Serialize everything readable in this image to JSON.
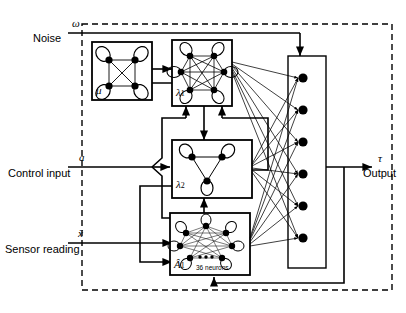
{
  "figure": {
    "background": "#ffffff",
    "stroke_color": "#000000",
    "node_fill": "#000000",
    "width": 406,
    "height": 313
  },
  "inputs": [
    {
      "symbol": "ω",
      "label": "Noise"
    },
    {
      "symbol": "a",
      "label": "Control input"
    },
    {
      "symbol": "ẍ",
      "label": "Sensor reading"
    }
  ],
  "output": {
    "symbol": "τ",
    "label": "Output"
  },
  "blocks": [
    {
      "id": "mu",
      "label": "μ",
      "sublabel": "",
      "neurons": 4,
      "note": ""
    },
    {
      "id": "lambda1",
      "label": "λ",
      "sublabel": "1",
      "neurons": 6,
      "note": ""
    },
    {
      "id": "lambda2",
      "label": "λ",
      "sublabel": "2",
      "neurons": 3,
      "note": ""
    },
    {
      "id": "ahat",
      "label": "Â",
      "sublabel": "1",
      "neurons": 12,
      "note": "36 neurons"
    }
  ],
  "output_layer": {
    "nodes": 6,
    "label": ""
  },
  "boundary": {
    "style": "dashed",
    "label": ""
  }
}
